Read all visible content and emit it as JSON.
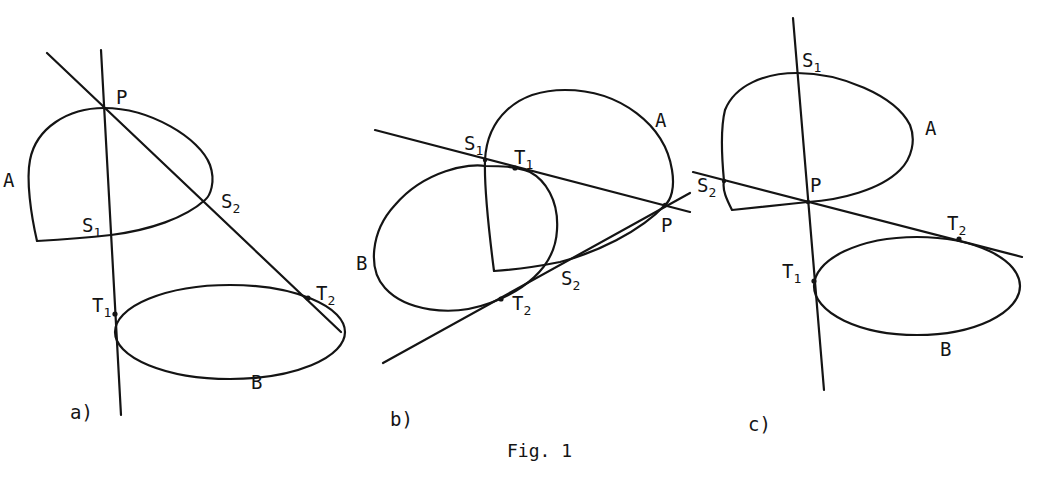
{
  "figure": {
    "caption": "Fig. 1",
    "panels": [
      {
        "id": "a",
        "label": "a)",
        "curves": {
          "A": "A",
          "B": "B"
        },
        "points": {
          "P": {
            "main": "P",
            "sub": ""
          },
          "S1": {
            "main": "S",
            "sub": "1"
          },
          "S2": {
            "main": "S",
            "sub": "2"
          },
          "T1": {
            "main": "T",
            "sub": "1"
          },
          "T2": {
            "main": "T",
            "sub": "2"
          }
        }
      },
      {
        "id": "b",
        "label": "b)",
        "curves": {
          "A": "A",
          "B": "B"
        },
        "points": {
          "P": {
            "main": "P",
            "sub": ""
          },
          "S1": {
            "main": "S",
            "sub": "1"
          },
          "S2": {
            "main": "S",
            "sub": "2"
          },
          "T1": {
            "main": "T",
            "sub": "1"
          },
          "T2": {
            "main": "T",
            "sub": "2"
          }
        }
      },
      {
        "id": "c",
        "label": "c)",
        "curves": {
          "A": "A",
          "B": "B"
        },
        "points": {
          "P": {
            "main": "P",
            "sub": ""
          },
          "S1": {
            "main": "S",
            "sub": "1"
          },
          "S2": {
            "main": "S",
            "sub": "2"
          },
          "T1": {
            "main": "T",
            "sub": "1"
          },
          "T2": {
            "main": "T",
            "sub": "2"
          }
        }
      }
    ]
  },
  "colors": {
    "ink": "#141414",
    "background": "#ffffff"
  }
}
